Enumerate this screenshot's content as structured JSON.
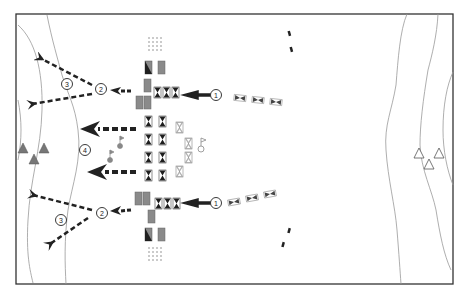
{
  "diagram": {
    "type": "tactical formation diagram",
    "frame": {
      "x": 16,
      "y": 14,
      "width": 437,
      "height": 270,
      "stroke": "#333333"
    },
    "colors": {
      "dark_unit": "#2a2a2a",
      "grey_unit": "#8a8a8a",
      "arrow": "#222222",
      "terrain_line": "#999999",
      "filled_triangle": "#777777",
      "outline_triangle": "#555555"
    },
    "labels": {
      "phase_1_top": "1",
      "phase_1_bottom": "1",
      "phase_2_top": "2",
      "phase_2_bottom": "2",
      "phase_3_top": "3",
      "phase_3_bottom": "3",
      "phase_4": "4"
    },
    "legend_items": [
      {
        "symbol": "circled-number-1",
        "meaning": "phase 1 advance"
      },
      {
        "symbol": "circled-number-2",
        "meaning": "phase 2 split"
      },
      {
        "symbol": "circled-number-3",
        "meaning": "phase 3 envelopment"
      },
      {
        "symbol": "circled-number-4",
        "meaning": "phase 4 central thrust"
      }
    ]
  }
}
